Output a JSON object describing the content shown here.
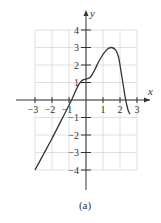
{
  "chart_data": {
    "type": "line",
    "title": "",
    "caption": "(a)",
    "xlabel": "x",
    "ylabel": "y",
    "xlim": [
      -3,
      3
    ],
    "ylim": [
      -4,
      4
    ],
    "grid": true,
    "x_ticks": [
      -3,
      -2,
      -1,
      1,
      2,
      3
    ],
    "y_ticks": [
      -4,
      -3,
      -2,
      -1,
      1,
      2,
      3,
      4
    ],
    "x_tick_labels": [
      "−3",
      "−2",
      "−1",
      "1",
      "2",
      "3"
    ],
    "y_tick_labels": [
      "−4",
      "−3",
      "−2",
      "−1",
      "1",
      "2",
      "3",
      "4"
    ],
    "series": [
      {
        "name": "f(x)",
        "x": [
          -3.0,
          -2.5,
          -2.0,
          -1.5,
          -1.0,
          -0.8,
          -0.5,
          -0.25,
          0.0,
          0.25,
          0.5,
          0.75,
          1.0,
          1.25,
          1.5,
          1.75,
          1.9,
          2.0,
          2.1,
          2.2,
          2.3,
          2.4,
          2.5,
          2.6
        ],
        "y": [
          -4.0,
          -3.1,
          -2.2,
          -1.25,
          -0.3,
          0.1,
          0.75,
          1.1,
          1.2,
          1.3,
          1.7,
          2.2,
          2.6,
          2.9,
          3.0,
          2.85,
          2.5,
          2.0,
          1.4,
          0.8,
          0.2,
          -0.3,
          -0.65,
          -0.8
        ]
      }
    ]
  },
  "axes": {
    "x_label": "x",
    "y_label": "y"
  },
  "figure": {
    "caption": "(a)"
  },
  "colors": {
    "curve": "#333333",
    "axis": "#333333",
    "grid": "#d8d8d8"
  }
}
